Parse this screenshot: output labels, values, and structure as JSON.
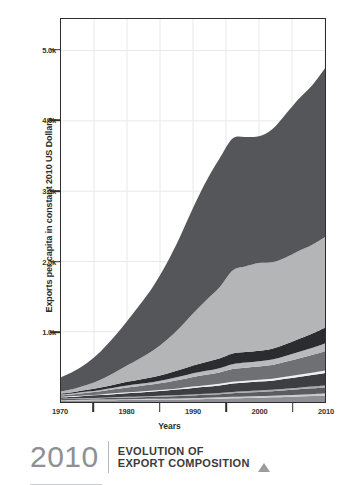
{
  "footer": {
    "year": "2010",
    "title_line1": "EVOLUTION OF",
    "title_line2": "EXPORT COMPOSITION",
    "marker_icon": "triangle-up-icon"
  },
  "axes": {
    "ylabel": "Exports per capita in constant 2010 US Dollars",
    "xlabel": "Years",
    "yticks": [
      "1.0k",
      "2.0k",
      "3.0k",
      "4.0k",
      "5.0k"
    ],
    "ytick_values": [
      1000,
      2000,
      3000,
      4000,
      5000
    ],
    "xticks": [
      "1970",
      "1980",
      "1990",
      "2000",
      "2010"
    ],
    "xtick_values": [
      1970,
      1980,
      1990,
      2000,
      2010
    ],
    "xminor_values": [
      1975,
      1985,
      1995,
      2005
    ]
  },
  "colors": {
    "band_1": "#8d8f92",
    "band_2": "#c9cacb",
    "band_3": "#5b5c60",
    "band_4": "#a9aaad",
    "band_5": "#3d3e42",
    "band_6": "#f0f0f0",
    "band_7": "#6e7074",
    "band_8": "#b9babd",
    "band_9": "#2b2c30",
    "band_10": "#b4b5b7",
    "band_11": "#55565a",
    "axis": "#2e2e2e",
    "grid": "#e8e8ea",
    "background": "#ffffff",
    "footer_year": "#8f9093",
    "footer_title": "#3a3b3d",
    "footer_marker": "#9b9c9e"
  },
  "chart_data": {
    "type": "area",
    "title": "EVOLUTION OF EXPORT COMPOSITION",
    "subtitle": "2010",
    "xlabel": "Years",
    "ylabel": "Exports per capita in constant 2010 US Dollars",
    "stacked": true,
    "grid": true,
    "legend": "none",
    "xlim": [
      1970,
      2010
    ],
    "ylim": [
      0,
      5450
    ],
    "x": [
      1970,
      1972,
      1974,
      1976,
      1978,
      1980,
      1982,
      1984,
      1986,
      1988,
      1990,
      1992,
      1994,
      1996,
      1998,
      2000,
      2002,
      2004,
      2006,
      2008,
      2010
    ],
    "series": [
      {
        "name": "band-1",
        "color": "#8d8f92",
        "values": [
          18,
          20,
          22,
          24,
          26,
          28,
          30,
          32,
          34,
          36,
          40,
          44,
          48,
          54,
          58,
          62,
          66,
          72,
          78,
          84,
          90
        ]
      },
      {
        "name": "band-2",
        "color": "#c9cacb",
        "values": [
          8,
          9,
          10,
          10,
          11,
          12,
          12,
          13,
          14,
          15,
          16,
          17,
          18,
          20,
          21,
          22,
          23,
          25,
          26,
          28,
          30
        ]
      },
      {
        "name": "band-3",
        "color": "#5b5c60",
        "values": [
          14,
          16,
          18,
          20,
          22,
          24,
          26,
          28,
          31,
          34,
          38,
          42,
          46,
          52,
          56,
          60,
          64,
          70,
          76,
          82,
          88
        ]
      },
      {
        "name": "band-4",
        "color": "#a9aaad",
        "values": [
          6,
          7,
          8,
          8,
          9,
          10,
          10,
          11,
          12,
          13,
          14,
          15,
          16,
          18,
          19,
          20,
          21,
          23,
          24,
          26,
          28
        ]
      },
      {
        "name": "band-5",
        "color": "#3d3e42",
        "values": [
          20,
          24,
          30,
          36,
          44,
          52,
          58,
          64,
          72,
          82,
          92,
          100,
          108,
          120,
          124,
          126,
          130,
          140,
          152,
          164,
          178
        ]
      },
      {
        "name": "band-6",
        "color": "#f0f0f0",
        "values": [
          7,
          8,
          9,
          10,
          11,
          12,
          13,
          14,
          15,
          17,
          19,
          20,
          22,
          24,
          25,
          26,
          27,
          29,
          31,
          33,
          36
        ]
      },
      {
        "name": "band-7",
        "color": "#6e7074",
        "values": [
          22,
          28,
          36,
          46,
          58,
          70,
          80,
          90,
          104,
          120,
          138,
          150,
          162,
          180,
          186,
          190,
          196,
          212,
          232,
          252,
          274
        ]
      },
      {
        "name": "band-8",
        "color": "#b9babd",
        "values": [
          10,
          12,
          15,
          18,
          22,
          26,
          30,
          34,
          39,
          45,
          52,
          57,
          62,
          70,
          72,
          74,
          77,
          84,
          92,
          100,
          110
        ]
      },
      {
        "name": "band-9",
        "color": "#2b2c30",
        "values": [
          16,
          20,
          26,
          34,
          44,
          54,
          62,
          70,
          82,
          96,
          112,
          124,
          136,
          152,
          150,
          148,
          154,
          168,
          186,
          204,
          224
        ]
      },
      {
        "name": "band-10",
        "color": "#b4b5b7",
        "values": [
          30,
          45,
          70,
          110,
          165,
          230,
          300,
          380,
          480,
          600,
          740,
          880,
          1010,
          1180,
          1220,
          1250,
          1230,
          1230,
          1250,
          1260,
          1290
        ]
      },
      {
        "name": "band-11",
        "color": "#55565a",
        "values": [
          199,
          251,
          316,
          404,
          508,
          632,
          769,
          914,
          1087,
          1288,
          1499,
          1691,
          1832,
          1880,
          1839,
          1802,
          1892,
          2037,
          2163,
          2267,
          2402
        ]
      }
    ],
    "totals": [
      350,
      440,
      560,
      720,
      920,
      1150,
      1390,
      1650,
      1970,
      2348,
      2760,
      3140,
      3458,
      3950,
      3970,
      3980,
      4080,
      4320,
      4550,
      4760,
      5050
    ]
  }
}
